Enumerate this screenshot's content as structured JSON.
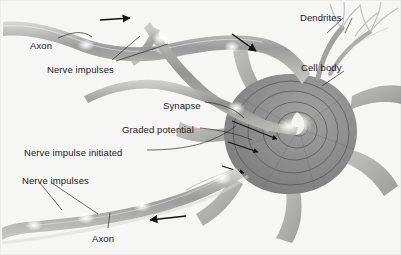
{
  "figure": {
    "background_color": "#f6f6f4",
    "cell_color": "#8c8c8c",
    "axon_color": "#9a9a9a",
    "arrow_color": "#111111",
    "leader_color": "#2b2b2b",
    "text_color": "#1a1a1a"
  },
  "labels": [
    {
      "id": "axon-top",
      "text": "Axon",
      "x": 30,
      "y": 40
    },
    {
      "id": "nerve-impulses-top",
      "text": "Nerve impulses",
      "x": 47,
      "y": 64
    },
    {
      "id": "dendrites",
      "text": "Dendrites",
      "x": 300,
      "y": 12
    },
    {
      "id": "cell-body",
      "text": "Cell body",
      "x": 301,
      "y": 62
    },
    {
      "id": "synapse",
      "text": "Synapse",
      "x": 163,
      "y": 100
    },
    {
      "id": "graded-potential",
      "text": "Graded potential",
      "x": 122,
      "y": 124
    },
    {
      "id": "nerve-impulse-initiated",
      "text": "Nerve impulse initiated",
      "x": 24,
      "y": 147
    },
    {
      "id": "nerve-impulses-bottom",
      "text": "Nerve impulses",
      "x": 22,
      "y": 175
    },
    {
      "id": "axon-bottom",
      "text": "Axon",
      "x": 92,
      "y": 233
    }
  ],
  "arrows": [
    {
      "id": "impulse-arrow-incoming-upper",
      "direction": "right",
      "x": 100,
      "y": 17
    },
    {
      "id": "impulse-arrow-incoming-lower",
      "direction": "down-right",
      "x": 232,
      "y": 34
    },
    {
      "id": "impulse-arrow-outgoing",
      "direction": "left",
      "x": 140,
      "y": 218
    }
  ],
  "structures": [
    {
      "id": "incoming-axon-upper",
      "name": "Axon (presynaptic, upper)"
    },
    {
      "id": "incoming-axon-lower",
      "name": "Axon (presynaptic, lower)"
    },
    {
      "id": "synaptic-terminal",
      "name": "Synaptic contact on cell body"
    },
    {
      "id": "soma",
      "name": "Cell body (soma)"
    },
    {
      "id": "graded-potential-rings",
      "name": "Concentric graded potential wavefronts"
    },
    {
      "id": "dendrite-branches",
      "name": "Dendrites"
    },
    {
      "id": "outgoing-axon",
      "name": "Axon (postsynaptic, outgoing)"
    },
    {
      "id": "impulse-nodes",
      "name": "Bright nerve impulse nodes"
    }
  ]
}
